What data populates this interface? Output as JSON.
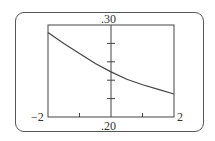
{
  "chart_data": {
    "type": "line",
    "title": "",
    "xlabel": "",
    "ylabel": "",
    "xlim": [
      -2,
      2
    ],
    "ylim": [
      0.2,
      0.3
    ],
    "x_tick_labels": [
      "-2",
      "2"
    ],
    "y_tick_labels": [
      ".30",
      ".20"
    ],
    "x_ticks": [
      -1,
      1
    ],
    "y_ticks": [
      0.22,
      0.24,
      0.26,
      0.28
    ],
    "grid": false,
    "series": [
      {
        "name": "f(x)",
        "x": [
          -2,
          -1.5,
          -1,
          -0.5,
          0,
          0.5,
          1,
          1.5,
          2
        ],
        "y": [
          0.292,
          0.28,
          0.269,
          0.258,
          0.249,
          0.241,
          0.235,
          0.23,
          0.225
        ]
      }
    ]
  },
  "labels": {
    "y_max": ".30",
    "y_min": ".20",
    "x_min": "−2",
    "x_max": "2"
  }
}
